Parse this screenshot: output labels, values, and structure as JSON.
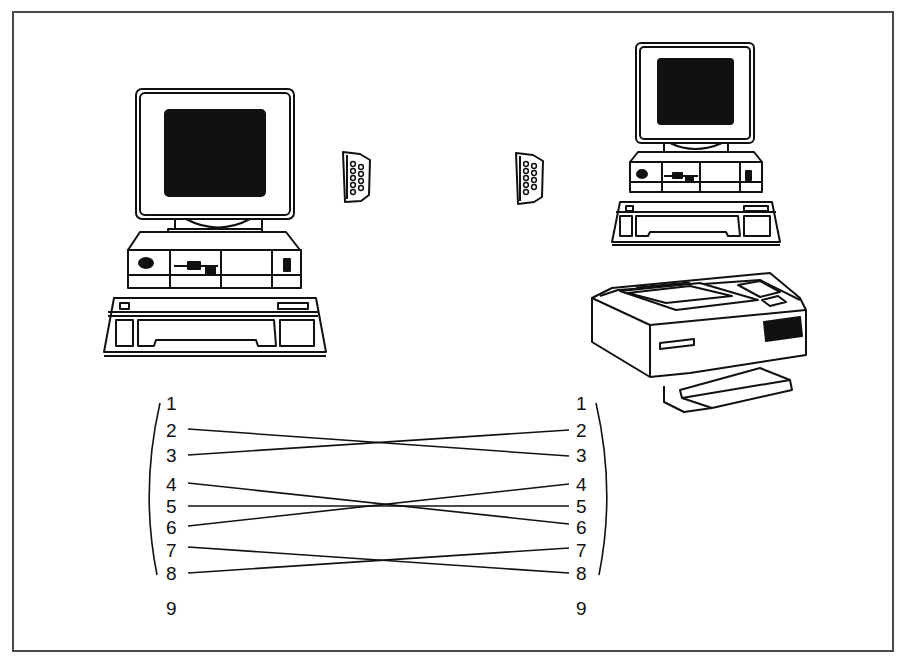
{
  "diagram": {
    "type": "null-modem serial cable wiring",
    "devices": [
      {
        "id": "pc-left",
        "label": "Desktop computer (left)"
      },
      {
        "id": "pc-right",
        "label": "Desktop computer (right)"
      },
      {
        "id": "printer",
        "label": "Laser printer"
      }
    ],
    "connectors": [
      {
        "id": "db9-left",
        "label": "DB-9 connector"
      },
      {
        "id": "db9-right",
        "label": "DB-9 connector"
      }
    ],
    "left_pins": [
      "1",
      "2",
      "3",
      "4",
      "5",
      "6",
      "7",
      "8",
      "9"
    ],
    "right_pins": [
      "1",
      "2",
      "3",
      "4",
      "5",
      "6",
      "7",
      "8",
      "9"
    ],
    "wires": [
      {
        "from": "2",
        "to": "3"
      },
      {
        "from": "3",
        "to": "2"
      },
      {
        "from": "4",
        "to": "6"
      },
      {
        "from": "5",
        "to": "5"
      },
      {
        "from": "6",
        "to": "4"
      },
      {
        "from": "7",
        "to": "8"
      },
      {
        "from": "8",
        "to": "7"
      }
    ]
  }
}
